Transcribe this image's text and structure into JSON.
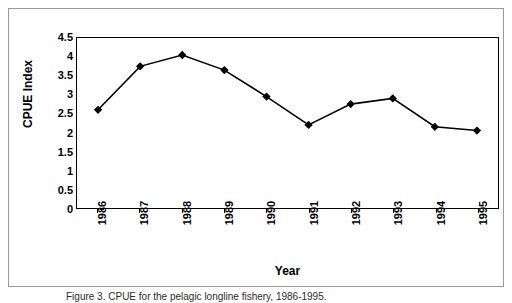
{
  "figure": {
    "caption": "Figure 3.  CPUE for the pelagic longline fishery, 1986-1995."
  },
  "chart_data": {
    "type": "line",
    "title": "",
    "xlabel": "Year",
    "ylabel": "CPUE Index",
    "categories": [
      "1986",
      "1987",
      "1988",
      "1989",
      "1990",
      "1991",
      "1992",
      "1993",
      "1994",
      "1995"
    ],
    "values": [
      2.6,
      3.75,
      4.05,
      3.65,
      2.95,
      2.2,
      2.75,
      2.9,
      2.15,
      2.05
    ],
    "series": [
      {
        "name": "CPUE Index",
        "values": [
          2.6,
          3.75,
          4.05,
          3.65,
          2.95,
          2.2,
          2.75,
          2.9,
          2.15,
          2.05
        ]
      }
    ],
    "ylim": [
      0,
      4.5
    ],
    "ytick_labels": [
      "0",
      "0.5",
      "1",
      "1.5",
      "2",
      "2.5",
      "3",
      "3.5",
      "4",
      "4.5"
    ],
    "ytick_values": [
      0,
      0.5,
      1,
      1.5,
      2,
      2.5,
      3,
      3.5,
      4,
      4.5
    ],
    "xtick_labels": [
      "1986",
      "1987",
      "1988",
      "1989",
      "1990",
      "1991",
      "1992",
      "1993",
      "1994",
      "1995"
    ],
    "grid": false,
    "legend": "none",
    "marker": "diamond",
    "line_color": "#000000",
    "marker_color": "#000000",
    "plot_background": "#ffffff",
    "frame_color": "#000000"
  }
}
